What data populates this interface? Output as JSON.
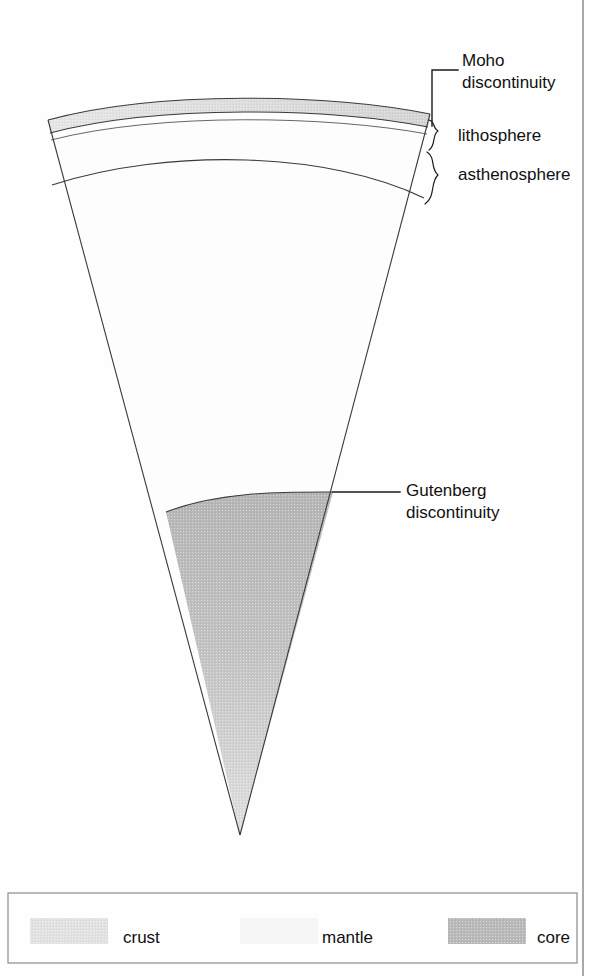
{
  "figure": {
    "type": "cross-section-diagram",
    "background_color": "#fefefe"
  },
  "annotations": [
    {
      "id": "moho",
      "line1": "Moho",
      "line2": "discontinuity",
      "text_x": 462,
      "text_y": 66,
      "leader": "M432,126 L432,70 L458,70"
    },
    {
      "id": "lithosphere",
      "line1": "lithosphere",
      "line2": "",
      "text_x": 458,
      "text_y": 141,
      "leader": ""
    },
    {
      "id": "asthenosphere",
      "line1": "asthenosphere",
      "line2": "",
      "text_x": 458,
      "text_y": 180,
      "leader": ""
    },
    {
      "id": "gutenberg",
      "line1": "Gutenberg",
      "line2": "discontinuity",
      "text_x": 406,
      "text_y": 496,
      "leader": "M333,492 L400,492"
    }
  ],
  "layers": {
    "crust": {
      "name": "crust",
      "color": "#e2e2e2",
      "stroke": "#3a3a3a"
    },
    "mantle": {
      "name": "mantle",
      "color": "#fdfdfd",
      "stroke": "#3a3a3a"
    },
    "core": {
      "name": "core",
      "color": "#b9b9b9",
      "color_light": "#dcdcdc",
      "stroke": "#3a3a3a"
    }
  },
  "legend": {
    "box": {
      "x": 8,
      "y": 893,
      "width": 569,
      "height": 70
    },
    "items": [
      {
        "label": "crust",
        "swatch_color": "#e2e2e2",
        "swatch_x": 30,
        "swatch_y": 918,
        "swatch_w": 78,
        "swatch_h": 26,
        "text_x": 123,
        "text_y": 937
      },
      {
        "label": "mantle",
        "swatch_color": "#f6f6f6",
        "swatch_x": 240,
        "swatch_y": 918,
        "swatch_w": 78,
        "swatch_h": 26,
        "text_x": 322,
        "text_y": 937
      },
      {
        "label": "core",
        "swatch_color": "#b9b9b9",
        "swatch_x": 448,
        "swatch_y": 918,
        "swatch_w": 78,
        "swatch_h": 26,
        "text_x": 537,
        "text_y": 937
      }
    ]
  },
  "frame": {
    "right_rule_x": 583,
    "right_rule_y1": 0,
    "right_rule_y2": 976
  }
}
